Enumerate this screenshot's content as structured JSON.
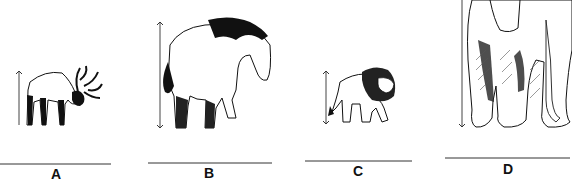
{
  "figure": {
    "panels": [
      {
        "label": "A",
        "animal": "reindeer",
        "icon": "reindeer-icon"
      },
      {
        "label": "B",
        "animal": "horse",
        "icon": "horse-icon"
      },
      {
        "label": "C",
        "animal": "lion",
        "icon": "lion-icon"
      },
      {
        "label": "D",
        "animal": "elephant",
        "icon": "elephant-icon"
      }
    ]
  }
}
